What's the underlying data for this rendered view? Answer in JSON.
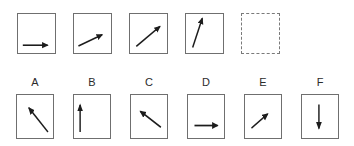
{
  "puzzle": {
    "kind": "arrow-rotation-sequence",
    "sequence_row": {
      "boxes": [
        {
          "name": "sequence-box-1",
          "border": "solid",
          "arrow": {
            "direction": "right",
            "angle_deg": 0,
            "line": {
              "x1": 13,
              "y1": 80,
              "x2": 80,
              "y2": 80
            }
          }
        },
        {
          "name": "sequence-box-2",
          "border": "solid",
          "arrow": {
            "direction": "up-right-shallow",
            "angle_deg": 25,
            "line": {
              "x1": 12,
              "y1": 82,
              "x2": 76,
              "y2": 53
            }
          }
        },
        {
          "name": "sequence-box-3",
          "border": "solid",
          "arrow": {
            "direction": "up-right",
            "angle_deg": 40,
            "line": {
              "x1": 17,
              "y1": 83,
              "x2": 81,
              "y2": 32
            }
          }
        },
        {
          "name": "sequence-box-4",
          "border": "solid",
          "arrow": {
            "direction": "up-steep",
            "angle_deg": 70,
            "line": {
              "x1": 18,
              "y1": 86,
              "x2": 44,
              "y2": 11
            }
          }
        },
        {
          "name": "sequence-box-5-missing",
          "border": "dashed",
          "arrow": null
        }
      ]
    },
    "options_row": {
      "options": [
        {
          "label": "A",
          "arrow": {
            "direction": "up-left-steep",
            "angle_deg": 129,
            "line": {
              "x1": 86,
              "y1": 86,
              "x2": 33,
              "y2": 30
            }
          }
        },
        {
          "label": "B",
          "arrow": {
            "direction": "up",
            "angle_deg": 90,
            "line": {
              "x1": 17,
              "y1": 86,
              "x2": 17,
              "y2": 23
            }
          }
        },
        {
          "label": "C",
          "arrow": {
            "direction": "up-left",
            "angle_deg": 142,
            "line": {
              "x1": 83,
              "y1": 75,
              "x2": 26,
              "y2": 38
            }
          }
        },
        {
          "label": "D",
          "arrow": {
            "direction": "right",
            "angle_deg": 0,
            "line": {
              "x1": 18,
              "y1": 71,
              "x2": 82,
              "y2": 71
            }
          }
        },
        {
          "label": "E",
          "arrow": {
            "direction": "up-right",
            "angle_deg": 39,
            "line": {
              "x1": 18,
              "y1": 77,
              "x2": 63,
              "y2": 44
            }
          }
        },
        {
          "label": "F",
          "arrow": {
            "direction": "down",
            "angle_deg": 270,
            "line": {
              "x1": 47,
              "y1": 22,
              "x2": 47,
              "y2": 78
            }
          }
        }
      ]
    }
  },
  "colors": {
    "arrow": "#1c1c1c",
    "box_border": "#6f6f6f",
    "dashed_border": "#7a7a7a",
    "label_text": "#2b2b2b",
    "background": "#ffffff"
  }
}
